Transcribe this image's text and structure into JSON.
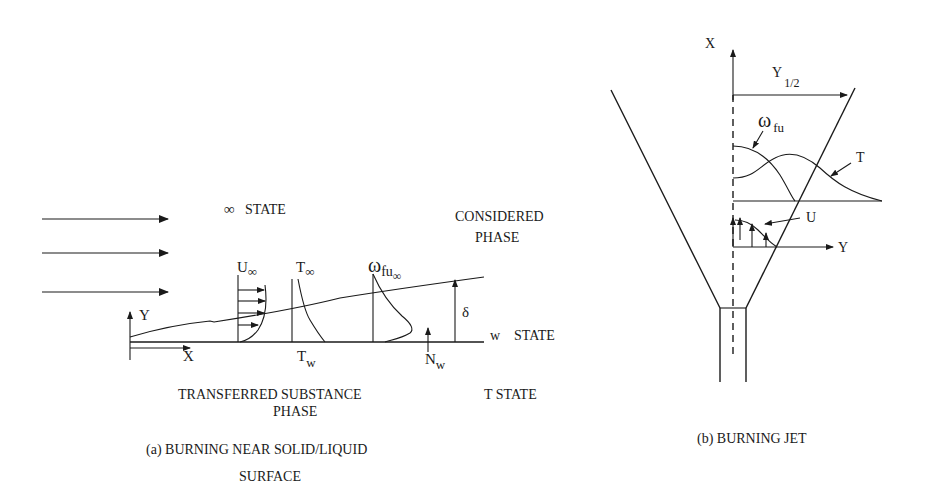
{
  "panel_a": {
    "caption_line1": "(a)  BURNING NEAR SOLID/LIQUID",
    "caption_line2": "SURFACE",
    "inf_symbol": "∞",
    "inf_state_label": "STATE",
    "considered_line1": "CONSIDERED",
    "considered_line2": "PHASE",
    "w_state_w": "w",
    "w_state_label": "STATE",
    "t_state_label": "T  STATE",
    "transferred_line1": "TRANSFERRED  SUBSTANCE",
    "transferred_line2": "PHASE",
    "axis_x": "X",
    "axis_y": "Y",
    "u_inf": "U",
    "u_inf_sub": "∞",
    "t_inf": "T",
    "t_inf_sub": "∞",
    "omega": "ω",
    "omega_sub": "fu",
    "omega_subsub": "∞",
    "delta": "δ",
    "t_w": "T",
    "t_w_sub": "w",
    "n_w": "N",
    "n_w_sub": "w"
  },
  "panel_b": {
    "caption": "(b)  BURNING JET",
    "axis_x": "X",
    "axis_y": "Y",
    "y_half": "Y",
    "y_half_sub": "1/2",
    "omega": "ω",
    "omega_sub": "fu",
    "t_label": "T",
    "u_label": "U"
  },
  "colors": {
    "ink": "#1a1a1a",
    "background": "#ffffff"
  }
}
